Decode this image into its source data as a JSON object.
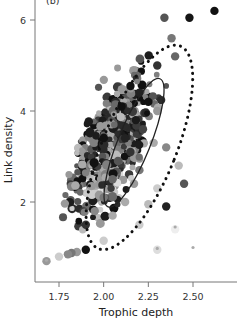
{
  "chart_data": {
    "type": "scatter",
    "panel_label": "(b)",
    "title": "",
    "xlabel": "Trophic depth",
    "ylabel": "Link density",
    "xlim": [
      1.6,
      2.75
    ],
    "ylim": [
      0.6,
      6.3
    ],
    "xticks": [
      1.75,
      2.0,
      2.25,
      2.5
    ],
    "xtick_labels": [
      "1.75",
      "2.00",
      "2.25",
      "2.50"
    ],
    "yticks": [
      2,
      4,
      6
    ],
    "ytick_labels": [
      "2",
      "4",
      "6"
    ],
    "grid": false,
    "legend": null,
    "annotations": [
      {
        "type": "ellipse",
        "style": "solid",
        "description": "inner confidence ellipse",
        "center": [
          2.17,
          3.3
        ],
        "spans_x": [
          2.0,
          2.33
        ],
        "spans_y": [
          1.6,
          4.7
        ]
      },
      {
        "type": "ellipse",
        "style": "dotted",
        "description": "outer confidence ellipse",
        "center": [
          2.2,
          3.2
        ],
        "spans_x": [
          1.82,
          2.57
        ],
        "spans_y": [
          0.7,
          5.6
        ]
      }
    ],
    "points_note": "Several hundred points with grayscale shading (light gray to black) and varying sizes; points listed are approximate samples",
    "points": [
      {
        "x": 2.62,
        "y": 6.2,
        "shade": "#111111"
      },
      {
        "x": 2.48,
        "y": 6.05,
        "shade": "#151515"
      },
      {
        "x": 2.34,
        "y": 6.05,
        "shade": "#555555"
      },
      {
        "x": 2.38,
        "y": 5.6,
        "shade": "#777777"
      },
      {
        "x": 2.4,
        "y": 5.2,
        "shade": "#666666"
      },
      {
        "x": 2.3,
        "y": 5.0,
        "shade": "#333333"
      },
      {
        "x": 2.15,
        "y": 4.55,
        "shade": "#111111"
      },
      {
        "x": 2.2,
        "y": 4.4,
        "shade": "#222222"
      },
      {
        "x": 2.25,
        "y": 4.2,
        "shade": "#111111"
      },
      {
        "x": 2.1,
        "y": 4.1,
        "shade": "#111111"
      },
      {
        "x": 2.3,
        "y": 4.0,
        "shade": "#999999"
      },
      {
        "x": 2.18,
        "y": 3.8,
        "shade": "#1a1a1a"
      },
      {
        "x": 2.22,
        "y": 3.6,
        "shade": "#444444"
      },
      {
        "x": 2.12,
        "y": 3.4,
        "shade": "#222222"
      },
      {
        "x": 2.28,
        "y": 3.3,
        "shade": "#aaaaaa"
      },
      {
        "x": 2.15,
        "y": 3.1,
        "shade": "#333333"
      },
      {
        "x": 2.35,
        "y": 3.2,
        "shade": "#888888"
      },
      {
        "x": 2.08,
        "y": 2.9,
        "shade": "#555555"
      },
      {
        "x": 2.2,
        "y": 2.7,
        "shade": "#777777"
      },
      {
        "x": 2.42,
        "y": 2.8,
        "shade": "#bbbbbb"
      },
      {
        "x": 2.05,
        "y": 2.5,
        "shade": "#666666"
      },
      {
        "x": 2.17,
        "y": 2.4,
        "shade": "#999999"
      },
      {
        "x": 2.3,
        "y": 2.3,
        "shade": "#cccccc"
      },
      {
        "x": 2.45,
        "y": 2.4,
        "shade": "#555555"
      },
      {
        "x": 2.0,
        "y": 2.1,
        "shade": "#777777"
      },
      {
        "x": 2.12,
        "y": 2.0,
        "shade": "#aaaaaa"
      },
      {
        "x": 2.25,
        "y": 1.95,
        "shade": "#bbbbbb"
      },
      {
        "x": 2.35,
        "y": 1.9,
        "shade": "#222222"
      },
      {
        "x": 1.95,
        "y": 1.8,
        "shade": "#888888"
      },
      {
        "x": 2.05,
        "y": 1.7,
        "shade": "#aaaaaa"
      },
      {
        "x": 2.2,
        "y": 1.5,
        "shade": "#cccccc"
      },
      {
        "x": 1.9,
        "y": 1.5,
        "shade": "#333333"
      },
      {
        "x": 1.9,
        "y": 0.95,
        "shade": "#111111"
      },
      {
        "x": 1.85,
        "y": 0.9,
        "shade": "#999999"
      },
      {
        "x": 1.82,
        "y": 0.88,
        "shade": "#777777"
      },
      {
        "x": 1.8,
        "y": 0.85,
        "shade": "#888888"
      },
      {
        "x": 1.75,
        "y": 0.8,
        "shade": "#cccccc"
      },
      {
        "x": 2.0,
        "y": 1.15,
        "shade": "#cccccc"
      },
      {
        "x": 1.68,
        "y": 0.7,
        "shade": "#999999"
      },
      {
        "x": 2.3,
        "y": 0.95,
        "shade": "#dddddd"
      },
      {
        "x": 2.4,
        "y": 1.4,
        "shade": "#eeeeee"
      }
    ]
  }
}
